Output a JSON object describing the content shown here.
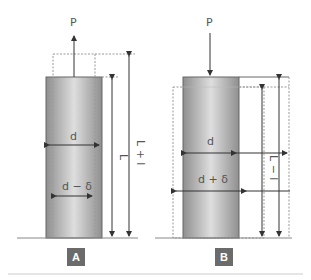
{
  "diagram": {
    "panel_a": {
      "badge": "A",
      "load_label": "P",
      "load_direction": "up (tension)",
      "label_d": "d",
      "label_d_minus": "d − δ",
      "label_L": "L",
      "label_L_plus": "L + l"
    },
    "panel_b": {
      "badge": "B",
      "load_label": "P",
      "load_direction": "down (compression)",
      "label_d": "d",
      "label_d_plus": "d + δ",
      "label_L_minus": "L − l"
    },
    "colors": {
      "cylinder_dark": "#8f8f8f",
      "cylinder_light": "#dcdcdc",
      "badge": "#6b6b6b",
      "line": "#333333",
      "dotted": "#999999"
    }
  }
}
